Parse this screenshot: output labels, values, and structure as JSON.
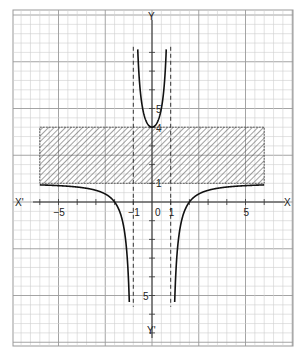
{
  "chart_data": {
    "type": "line",
    "title": "",
    "function": "y = (x^2 - 4) / (x^2 - 1)",
    "xlabel": "X",
    "xlabel_neg": "X'",
    "ylabel": "Y",
    "ylabel_neg": "Y'",
    "origin_label": "0",
    "x_ticks": [
      {
        "value": -5,
        "label": "-5"
      },
      {
        "value": -1,
        "label": "-1"
      },
      {
        "value": 1,
        "label": "1"
      },
      {
        "value": 5,
        "label": "5"
      }
    ],
    "y_ticks": [
      {
        "value": 5,
        "label": "5"
      },
      {
        "value": 4,
        "label": "4"
      },
      {
        "value": 1,
        "label": "1"
      },
      {
        "value": -5,
        "label": "5"
      }
    ],
    "xlim": [
      -7.5,
      7.5
    ],
    "ylim": [
      -7.7,
      10
    ],
    "grid": true,
    "asymptotes": [
      {
        "type": "vertical",
        "x": -1,
        "style": "dashed"
      },
      {
        "type": "vertical",
        "x": 1,
        "style": "dashed"
      }
    ],
    "shaded_region": {
      "x_range": [
        -6,
        6
      ],
      "y_range": [
        1,
        4
      ],
      "pattern": "hatched",
      "meaning": "excluded range 1 < y < 4"
    },
    "series": [
      {
        "name": "left branch",
        "x_range": [
          -6,
          -1.05
        ],
        "points": [
          [
            -6,
            0.914
          ],
          [
            -5,
            0.875
          ],
          [
            -4,
            0.8
          ],
          [
            -3,
            0.625
          ],
          [
            -2,
            0
          ],
          [
            -1.5,
            -1.4
          ],
          [
            -1.2,
            -5.09
          ],
          [
            -1.15,
            -7.0
          ]
        ]
      },
      {
        "name": "middle branch",
        "x_range": [
          -0.85,
          0.85
        ],
        "points": [
          [
            -0.85,
            8.8
          ],
          [
            -0.5,
            5.0
          ],
          [
            0,
            4
          ],
          [
            0.5,
            5.0
          ],
          [
            0.85,
            8.8
          ]
        ]
      },
      {
        "name": "right branch",
        "x_range": [
          1.05,
          6
        ],
        "points": [
          [
            1.15,
            -7.0
          ],
          [
            1.2,
            -5.09
          ],
          [
            1.5,
            -1.4
          ],
          [
            2,
            0
          ],
          [
            3,
            0.625
          ],
          [
            4,
            0.8
          ],
          [
            5,
            0.875
          ],
          [
            6,
            0.914
          ]
        ]
      }
    ]
  }
}
